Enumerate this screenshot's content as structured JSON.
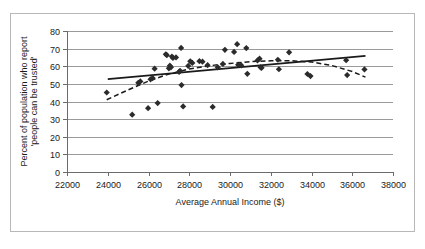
{
  "chart_data": {
    "type": "scatter",
    "title": "",
    "xlabel": "Average Annual Income ($)",
    "ylabel": "Percent of population who report 'people can be trusted'",
    "ylabel_line1": "Percent of population who report",
    "ylabel_line2": "'people can be trusted'",
    "xlim": [
      22000,
      38000
    ],
    "ylim": [
      0,
      80
    ],
    "xticks": [
      22000,
      24000,
      26000,
      28000,
      30000,
      32000,
      34000,
      36000,
      38000
    ],
    "yticks": [
      0,
      10,
      20,
      30,
      40,
      50,
      60,
      70,
      80
    ],
    "xtick_labels": [
      "22000",
      "24000",
      "26000",
      "28000",
      "30000",
      "32000",
      "34000",
      "36000",
      "38000"
    ],
    "ytick_labels": [
      "0",
      "10",
      "20",
      "30",
      "40",
      "50",
      "60",
      "70",
      "80"
    ],
    "grid": "horizontal",
    "legend": "none",
    "marker_shape": "diamond",
    "marker_color": "#2b2b2b",
    "points": [
      {
        "x": 23950,
        "y": 45.1
      },
      {
        "x": 25200,
        "y": 32.5
      },
      {
        "x": 25500,
        "y": 50.6
      },
      {
        "x": 25600,
        "y": 51.4
      },
      {
        "x": 25980,
        "y": 36.2
      },
      {
        "x": 26100,
        "y": 52.6
      },
      {
        "x": 26200,
        "y": 53.3
      },
      {
        "x": 26300,
        "y": 58.6
      },
      {
        "x": 26450,
        "y": 39.1
      },
      {
        "x": 26850,
        "y": 66.8
      },
      {
        "x": 26900,
        "y": 66.3
      },
      {
        "x": 27000,
        "y": 58.8
      },
      {
        "x": 27050,
        "y": 60.3
      },
      {
        "x": 27100,
        "y": 59.4
      },
      {
        "x": 27150,
        "y": 65.5
      },
      {
        "x": 27200,
        "y": 64.7
      },
      {
        "x": 27350,
        "y": 65.0
      },
      {
        "x": 27500,
        "y": 56.8
      },
      {
        "x": 27550,
        "y": 57.4
      },
      {
        "x": 27600,
        "y": 70.4
      },
      {
        "x": 27620,
        "y": 49.3
      },
      {
        "x": 27700,
        "y": 37.2
      },
      {
        "x": 27950,
        "y": 60.2
      },
      {
        "x": 28050,
        "y": 62.8
      },
      {
        "x": 28150,
        "y": 61.9
      },
      {
        "x": 28500,
        "y": 62.9
      },
      {
        "x": 28650,
        "y": 62.6
      },
      {
        "x": 28900,
        "y": 60.6
      },
      {
        "x": 29150,
        "y": 36.9
      },
      {
        "x": 29400,
        "y": 59.4
      },
      {
        "x": 29650,
        "y": 61.3
      },
      {
        "x": 29750,
        "y": 69.3
      },
      {
        "x": 30200,
        "y": 68.1
      },
      {
        "x": 30350,
        "y": 72.5
      },
      {
        "x": 30400,
        "y": 60.8
      },
      {
        "x": 30550,
        "y": 60.5
      },
      {
        "x": 30800,
        "y": 70.3
      },
      {
        "x": 30850,
        "y": 55.7
      },
      {
        "x": 31350,
        "y": 63.3
      },
      {
        "x": 31450,
        "y": 64.3
      },
      {
        "x": 31500,
        "y": 59.4
      },
      {
        "x": 31550,
        "y": 59.1
      },
      {
        "x": 32350,
        "y": 63.7
      },
      {
        "x": 32400,
        "y": 58.3
      },
      {
        "x": 32900,
        "y": 67.9
      },
      {
        "x": 33800,
        "y": 55.6
      },
      {
        "x": 33950,
        "y": 54.4
      },
      {
        "x": 35700,
        "y": 63.4
      },
      {
        "x": 35750,
        "y": 55.0
      },
      {
        "x": 36600,
        "y": 58.2
      }
    ],
    "trendlines": [
      {
        "name": "linear-trend",
        "style": "solid",
        "points": [
          {
            "x": 24000,
            "y": 52.7
          },
          {
            "x": 36650,
            "y": 65.9
          }
        ]
      },
      {
        "name": "polynomial-trend",
        "style": "dashed",
        "points": [
          {
            "x": 23950,
            "y": 41.0
          },
          {
            "x": 25000,
            "y": 46.6
          },
          {
            "x": 26000,
            "y": 51.6
          },
          {
            "x": 27000,
            "y": 55.6
          },
          {
            "x": 28000,
            "y": 58.4
          },
          {
            "x": 29000,
            "y": 60.3
          },
          {
            "x": 30000,
            "y": 61.6
          },
          {
            "x": 31000,
            "y": 62.6
          },
          {
            "x": 32000,
            "y": 63.1
          },
          {
            "x": 33000,
            "y": 63.1
          },
          {
            "x": 34000,
            "y": 62.4
          },
          {
            "x": 35000,
            "y": 60.4
          },
          {
            "x": 36000,
            "y": 57.0
          },
          {
            "x": 36650,
            "y": 53.8
          }
        ]
      }
    ]
  }
}
